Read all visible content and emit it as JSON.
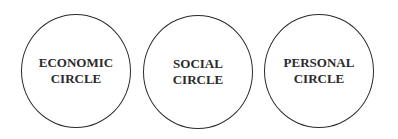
{
  "diagram": {
    "circles": [
      {
        "line1": "ECONOMIC",
        "line2": "CIRCLE"
      },
      {
        "line1": "SOCIAL",
        "line2": "CIRCLE"
      },
      {
        "line1": "PERSONAL",
        "line2": "CIRCLE"
      }
    ]
  }
}
